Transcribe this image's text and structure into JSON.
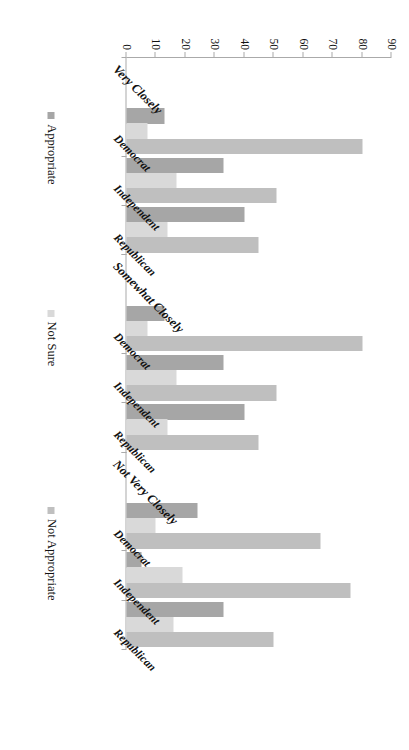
{
  "chart_data": {
    "type": "bar",
    "orientation": "vertical",
    "title": "",
    "xlabel": "",
    "ylabel": "",
    "ylim": [
      0,
      90
    ],
    "ytick_step": 10,
    "yticks": [
      "0",
      "10",
      "20",
      "30",
      "40",
      "50",
      "60",
      "70",
      "80",
      "90"
    ],
    "grid": false,
    "legend_position": "bottom",
    "group_labels": [
      "Very Closely",
      "Somewhat Closely",
      "Not Very Closely"
    ],
    "categories": [
      "Democrat",
      "Independent",
      "Republican"
    ],
    "series": [
      {
        "name": "Appropriate",
        "color": "#a6a6a6",
        "values_by_group": {
          "Very Closely": [
            80,
            33,
            40
          ],
          "Somewhat Closely": [
            13,
            33,
            40
          ],
          "Not Very Closely": [
            24,
            5,
            33
          ]
        }
      },
      {
        "name": "Not Sure",
        "color": "#d9d9d9",
        "values_by_group": {
          "Very Closely": [
            7,
            17,
            14
          ],
          "Somewhat Closely": [
            7,
            17,
            14
          ],
          "Not Very Closely": [
            10,
            19,
            16
          ]
        }
      },
      {
        "name": "Not Appropriate",
        "color": "#bfbfbf",
        "values_by_group": {
          "Very Closely": [
            80,
            51,
            45
          ],
          "Somewhat Closely": [
            80,
            51,
            45
          ],
          "Not Very Closely": [
            66,
            76,
            50
          ]
        }
      }
    ],
    "bars": [
      {
        "group": "Very Closely",
        "category": "Democrat",
        "series": "Not Appropriate",
        "value": 80,
        "color": "#bfbfbf"
      },
      {
        "group": "Very Closely",
        "category": "Democrat",
        "series": "Not Sure",
        "value": 7,
        "color": "#d9d9d9"
      },
      {
        "group": "Very Closely",
        "category": "Democrat",
        "series": "Appropriate",
        "value": 13,
        "color": "#a6a6a6"
      },
      {
        "group": "Very Closely",
        "category": "Independent",
        "series": "Not Appropriate",
        "value": 51,
        "color": "#bfbfbf"
      },
      {
        "group": "Very Closely",
        "category": "Independent",
        "series": "Not Sure",
        "value": 17,
        "color": "#d9d9d9"
      },
      {
        "group": "Very Closely",
        "category": "Independent",
        "series": "Appropriate",
        "value": 33,
        "color": "#a6a6a6"
      },
      {
        "group": "Very Closely",
        "category": "Republican",
        "series": "Not Appropriate",
        "value": 45,
        "color": "#bfbfbf"
      },
      {
        "group": "Very Closely",
        "category": "Republican",
        "series": "Not Sure",
        "value": 14,
        "color": "#d9d9d9"
      },
      {
        "group": "Very Closely",
        "category": "Republican",
        "series": "Appropriate",
        "value": 40,
        "color": "#a6a6a6"
      },
      {
        "group": "Somewhat Closely",
        "category": "Democrat",
        "series": "Not Appropriate",
        "value": 80,
        "color": "#bfbfbf"
      },
      {
        "group": "Somewhat Closely",
        "category": "Democrat",
        "series": "Not Sure",
        "value": 7,
        "color": "#d9d9d9"
      },
      {
        "group": "Somewhat Closely",
        "category": "Democrat",
        "series": "Appropriate",
        "value": 13,
        "color": "#a6a6a6"
      },
      {
        "group": "Somewhat Closely",
        "category": "Independent",
        "series": "Not Appropriate",
        "value": 51,
        "color": "#bfbfbf"
      },
      {
        "group": "Somewhat Closely",
        "category": "Independent",
        "series": "Not Sure",
        "value": 17,
        "color": "#d9d9d9"
      },
      {
        "group": "Somewhat Closely",
        "category": "Independent",
        "series": "Appropriate",
        "value": 33,
        "color": "#a6a6a6"
      },
      {
        "group": "Somewhat Closely",
        "category": "Republican",
        "series": "Not Appropriate",
        "value": 45,
        "color": "#bfbfbf"
      },
      {
        "group": "Somewhat Closely",
        "category": "Republican",
        "series": "Not Sure",
        "value": 14,
        "color": "#d9d9d9"
      },
      {
        "group": "Somewhat Closely",
        "category": "Republican",
        "series": "Appropriate",
        "value": 40,
        "color": "#a6a6a6"
      },
      {
        "group": "Not Very Closely",
        "category": "Democrat",
        "series": "Not Appropriate",
        "value": 66,
        "color": "#bfbfbf"
      },
      {
        "group": "Not Very Closely",
        "category": "Democrat",
        "series": "Not Sure",
        "value": 10,
        "color": "#d9d9d9"
      },
      {
        "group": "Not Very Closely",
        "category": "Democrat",
        "series": "Appropriate",
        "value": 24,
        "color": "#a6a6a6"
      },
      {
        "group": "Not Very Closely",
        "category": "Independent",
        "series": "Not Appropriate",
        "value": 76,
        "color": "#bfbfbf"
      },
      {
        "group": "Not Very Closely",
        "category": "Independent",
        "series": "Not Sure",
        "value": 19,
        "color": "#d9d9d9"
      },
      {
        "group": "Not Very Closely",
        "category": "Independent",
        "series": "Appropriate",
        "value": 5,
        "color": "#a6a6a6"
      },
      {
        "group": "Not Very Closely",
        "category": "Republican",
        "series": "Not Appropriate",
        "value": 50,
        "color": "#bfbfbf"
      },
      {
        "group": "Not Very Closely",
        "category": "Republican",
        "series": "Not Sure",
        "value": 16,
        "color": "#d9d9d9"
      },
      {
        "group": "Not Very Closely",
        "category": "Republican",
        "series": "Appropriate",
        "value": 33,
        "color": "#a6a6a6"
      }
    ],
    "legend": [
      {
        "label": "Appropriate",
        "color": "#a6a6a6"
      },
      {
        "label": "Not Sure",
        "color": "#d9d9d9"
      },
      {
        "label": "Not Appropriate",
        "color": "#bfbfbf"
      }
    ]
  }
}
